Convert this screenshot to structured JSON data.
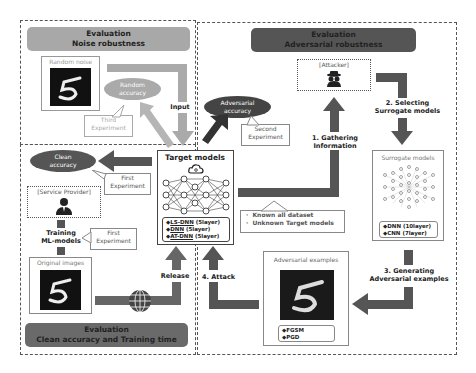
{
  "noise_section": {
    "header_line1": "Evaluation",
    "header_line2": "Noise robustness",
    "random_noise_label": "Random noise",
    "random_accuracy": [
      "Random",
      "accuracy"
    ],
    "third_experiment": [
      "Third",
      "Experiment"
    ],
    "input_label": "Input"
  },
  "adversarial_section": {
    "header_line1": "Evaluation",
    "header_line2": "Adversarial robustness",
    "attacker_label": "[Attacker]",
    "step1": [
      "1. Gathering",
      "Information"
    ],
    "step2": [
      "2. Selecting",
      "Surrogate models"
    ],
    "step3": [
      "3. Generating",
      "Adversarial examples"
    ],
    "step4": "4. Attack",
    "adversarial_accuracy": [
      "Adversarial",
      "accuracy"
    ],
    "second_experiment": [
      "Second",
      "Experiment"
    ],
    "knowledge": [
      "Known all dataset",
      "Unknown Target models"
    ],
    "surrogate_models_title": "Surrogate models",
    "surrogate_models_list": [
      "◆DNN (10layer)",
      "◆CNN (7layer)"
    ],
    "adv_examples_title": "Adversarial examples",
    "adv_examples_list": [
      "◆FGSM",
      "◆PGD"
    ]
  },
  "clean_section": {
    "header_line1": "Evaluation",
    "header_line2": "Clean accuracy  and  Training time",
    "clean_accuracy": [
      "Clean",
      "accuracy"
    ],
    "first_experiment_a": [
      "First",
      "Experiment"
    ],
    "first_experiment_b": [
      "First",
      "Experiment"
    ],
    "service_provider": "[Service Provider]",
    "training": [
      "Training",
      "ML-models"
    ],
    "original_images": "Original images",
    "release_label": "Release"
  },
  "target_models": {
    "title": "Target models",
    "list": [
      {
        "prefix": "◆",
        "name": "LS-DNN",
        "suffix": " (5layer)"
      },
      {
        "prefix": "◆",
        "name": "DNN",
        "suffix": " (5layer)"
      },
      {
        "prefix": "◆",
        "name": "AT-DNN",
        "suffix": " (5layer)"
      }
    ]
  },
  "icons": {
    "cloud": "cloud-icon",
    "globe": "globe-icon",
    "attacker": "spy-icon",
    "provider": "person-icon"
  },
  "colors": {
    "light_gray": "#aaaaaa",
    "mid_gray": "#777777",
    "dark_gray": "#555555",
    "black": "#111111"
  }
}
